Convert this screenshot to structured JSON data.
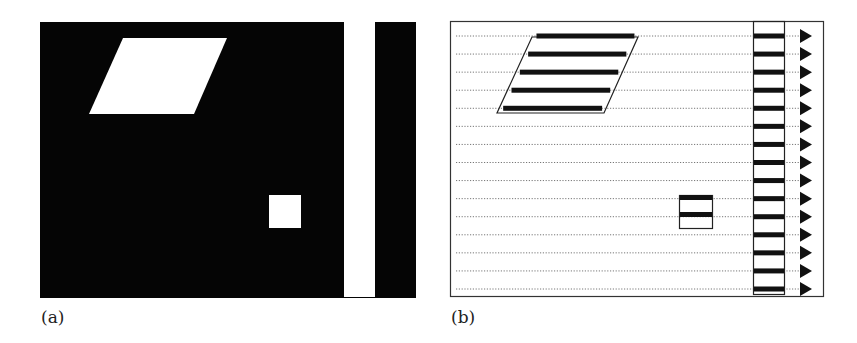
{
  "figure": {
    "panels": [
      {
        "id": "a",
        "label": "(a)",
        "description": "Binary image: black background with white parallelogram, white square, and white vertical bar",
        "colors": {
          "background": "#050505",
          "foreground": "#ffffff"
        }
      },
      {
        "id": "b",
        "label": "(b)",
        "description": "Scan-line representation: dotted horizontal scan lines with run segments drawn as thick bars inside outlined shapes; arrows at right of each scan line",
        "scan_line_count": 15,
        "parallelogram_runs": 5,
        "square_runs": 2,
        "bar_runs": 15,
        "colors": {
          "outline": "#333333",
          "run": "#111111",
          "scanline": "#777777",
          "arrow": "#111111"
        }
      }
    ]
  }
}
